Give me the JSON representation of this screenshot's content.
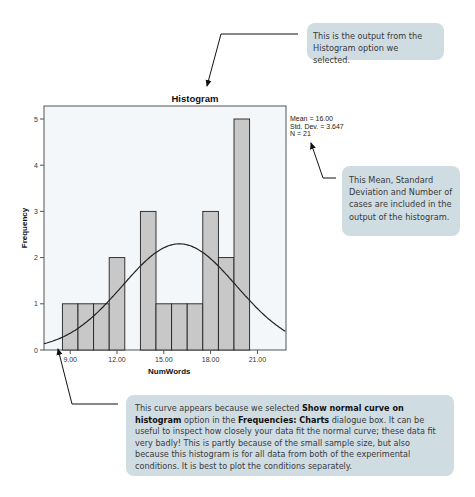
{
  "chart_data": {
    "type": "bar",
    "title": "Histogram",
    "xlabel": "NumWords",
    "ylabel": "Frequency",
    "categories": [
      9,
      10,
      11,
      12,
      13,
      14,
      15,
      16,
      17,
      18,
      19,
      20
    ],
    "values": [
      1,
      1,
      1,
      2,
      0,
      3,
      1,
      1,
      1,
      3,
      2,
      5
    ],
    "xticks": [
      "9.00",
      "12.00",
      "15.00",
      "18.00",
      "21.00"
    ],
    "yticks": [
      "0",
      "1",
      "2",
      "3",
      "4",
      "5"
    ],
    "xlim": [
      7.3,
      22.8
    ],
    "ylim": [
      0,
      5.3
    ],
    "grid": false,
    "bar_color": "#c8c8c8",
    "normal_curve": {
      "shown": true,
      "mean": 16.0,
      "std_dev": 3.647,
      "n": 21
    },
    "stats_legend": {
      "mean": "Mean = 16.00",
      "std_dev": "Std. Dev. = 3.647",
      "n": "N = 21"
    }
  },
  "annotations": {
    "top": "This is the output from the Histogram option we selected.",
    "stats": "This Mean, Standard Deviation and Number of cases are included in the output of the histogram.",
    "curve": {
      "part1": "This curve appears because we selected ",
      "bold1": "Show normal curve on histogram",
      "part2": " option in the ",
      "bold2": "Frequencies: Charts",
      "part3": " dialogue box. It can be useful to inspect how closely your data fit the normal curve; these data fit very badly! This is partly because of the small sample size, but also because this histogram is for all data from both of the experimental conditions. It is best to plot the conditions separately."
    }
  },
  "colors": {
    "callout_bg": "#cfdce2",
    "bar_fill": "#c8c8c8",
    "plot_bg": "#f4f7fa"
  }
}
